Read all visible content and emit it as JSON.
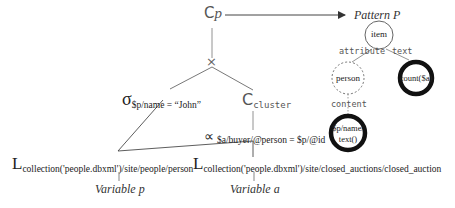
{
  "diagram": {
    "root": {
      "symbol": "C",
      "subscript": "p"
    },
    "join_symbol": "×",
    "selection": {
      "symbol": "σ",
      "condition": "$p/name = “John”"
    },
    "cluster": {
      "symbol": "C",
      "subscript": "cluster"
    },
    "semijoin": {
      "symbol": "∝",
      "condition": "$a/buyer/@person = $p/@id"
    },
    "left_leaf": {
      "symbol": "L",
      "path": "collection('people.dbxml')/site/people/person",
      "variable": "Variable p"
    },
    "right_leaf": {
      "symbol": "L",
      "path": "collection('people.dbxml')/site/closed_auctions/closed_auction",
      "variable": "Variable a"
    },
    "pattern": {
      "title": "Pattern P",
      "nodes": {
        "item": "item",
        "person": "person",
        "count": "count($a)",
        "name_line1": "$p/name/",
        "name_line2": "text()"
      },
      "edges": {
        "attribute": "attribute",
        "text": "text",
        "content": "content"
      }
    }
  }
}
